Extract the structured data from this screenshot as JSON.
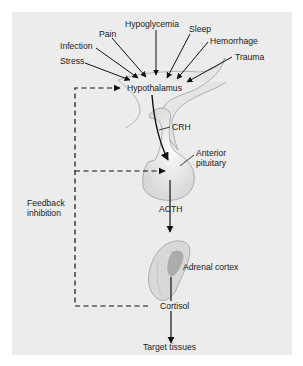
{
  "diagram": {
    "stressors": [
      "Stress",
      "Infection",
      "Pain",
      "Hypoglycemia",
      "Sleep",
      "Hemorrhage",
      "Trauma"
    ],
    "nodes": {
      "hypothalamus": "Hypothalamus",
      "crh": "CRH",
      "anterior_pituitary_line1": "Anterior",
      "anterior_pituitary_line2": "pituitary",
      "acth": "ACTH",
      "adrenal_cortex": "Adrenal cortex",
      "cortisol": "Cortisol",
      "target_tissues": "Target tissues"
    },
    "feedback": {
      "line1": "Feedback",
      "line2": "inhibition"
    },
    "colors": {
      "panel_bg": "#ececec",
      "gland_fill": "#e2e2e2",
      "gland_stroke": "#8a8a8a",
      "arrow": "#111111"
    }
  }
}
